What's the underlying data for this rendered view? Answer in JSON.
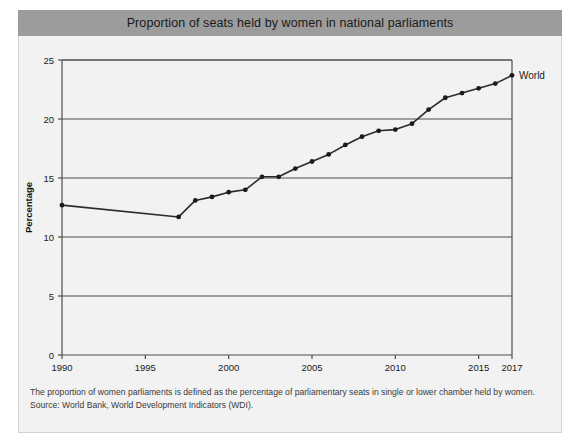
{
  "header": {
    "title": "Proportion of seats held by women in national parliaments"
  },
  "footnotes": {
    "line1": "The proportion of women parliaments is defined as the percentage of parliamentary seats in single or lower chamber held by women.",
    "line2": "Source: World Bank, World Development Indicators (WDI)."
  },
  "colors": {
    "title_band": "#9c9c9c",
    "card_background": "#f2f2f2",
    "plot_background": "#f2f2f2",
    "line": "#2b2b2b",
    "marker": "#1a1a1a",
    "grid": "#4d4d4d",
    "axis": "#4d4d4d",
    "page": "#ffffff"
  },
  "chart_data": {
    "type": "line",
    "title": "Proportion of seats held by women in national parliaments",
    "xlabel": "",
    "ylabel": "Percentage",
    "xlim": [
      1990,
      2017
    ],
    "ylim": [
      0,
      25
    ],
    "grid": true,
    "grid_axis": "y",
    "legend_position": "end-of-line",
    "y_ticks": [
      0,
      5,
      10,
      15,
      20,
      25
    ],
    "y_tick_labels": [
      "0",
      "5",
      "10",
      "15",
      "20",
      "25"
    ],
    "x_ticks": [
      1990,
      1995,
      2000,
      2005,
      2010,
      2015,
      2017
    ],
    "x_tick_labels": [
      "1990",
      "1995",
      "2000",
      "2005",
      "2010",
      "2015",
      "2017"
    ],
    "x": [
      1990,
      1991,
      1992,
      1993,
      1994,
      1995,
      1996,
      1997,
      1998,
      1999,
      2000,
      2001,
      2002,
      2003,
      2004,
      2005,
      2006,
      2007,
      2008,
      2009,
      2010,
      2011,
      2012,
      2013,
      2014,
      2015,
      2016,
      2017
    ],
    "series": [
      {
        "name": "World",
        "values": [
          12.7,
          null,
          null,
          null,
          null,
          null,
          null,
          11.7,
          13.1,
          13.4,
          13.8,
          14.0,
          15.1,
          15.1,
          15.8,
          16.4,
          17.0,
          17.8,
          18.5,
          19.0,
          19.1,
          19.6,
          20.8,
          21.8,
          22.2,
          22.6,
          23.0,
          23.7
        ],
        "annotation": "World"
      }
    ],
    "notes": [
      "The proportion of women parliaments is defined as the percentage of parliamentary seats in single or lower chamber held by women.",
      "Source: World Bank, World Development Indicators (WDI)."
    ]
  }
}
